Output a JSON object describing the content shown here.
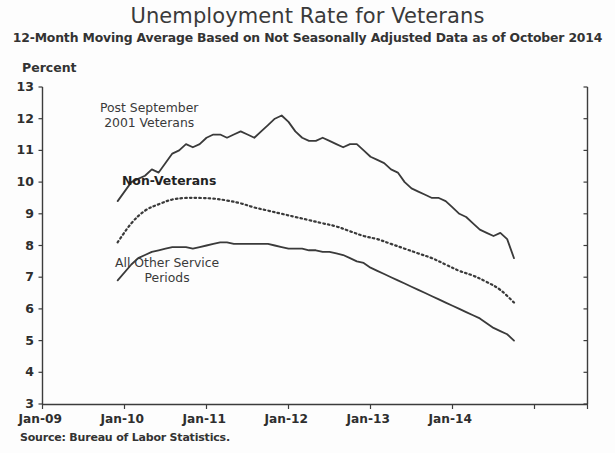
{
  "chart_data": {
    "type": "line",
    "title": "Unemployment Rate for Veterans",
    "subtitle": "12-Month Moving Average Based on Not Seasonally Adjusted Data as of October 2014",
    "ylabel": "Percent",
    "xlabel": "",
    "source": "Source: Bureau of Labor Statistics.",
    "ylim": [
      3,
      13
    ],
    "y_ticks": [
      3,
      4,
      5,
      6,
      7,
      8,
      9,
      10,
      11,
      12,
      13
    ],
    "x_tick_labels": [
      "Jan-09",
      "Jan-10",
      "Jan-11",
      "Jan-12",
      "Jan-13",
      "Jan-14"
    ],
    "x_range": [
      "Jan-09",
      "Jan-15"
    ],
    "grid": false,
    "legend": "inline-annotations",
    "series": [
      {
        "name": "Post September 2001 Veterans",
        "style": "solid",
        "color": "#3a3a3a",
        "x": [
          "Dec-09",
          "Feb-10",
          "Mar-10",
          "Apr-10",
          "May-10",
          "Jun-10",
          "Jul-10",
          "Aug-10",
          "Sep-10",
          "Oct-10",
          "Nov-10",
          "Dec-10",
          "Jan-11",
          "Feb-11",
          "Mar-11",
          "Apr-11",
          "May-11",
          "Jun-11",
          "Jul-11",
          "Aug-11",
          "Sep-11",
          "Oct-11",
          "Nov-11",
          "Dec-11",
          "Jan-12",
          "Feb-12",
          "Mar-12",
          "Apr-12",
          "May-12",
          "Jun-12",
          "Jul-12",
          "Aug-12",
          "Sep-12",
          "Oct-12",
          "Nov-12",
          "Dec-12",
          "Jan-13",
          "Feb-13",
          "Mar-13",
          "Apr-13",
          "May-13",
          "Jun-13",
          "Jul-13",
          "Aug-13",
          "Sep-13",
          "Oct-13",
          "Nov-13",
          "Dec-13",
          "Jan-14",
          "Feb-14",
          "Mar-14",
          "Apr-14",
          "May-14",
          "Jun-14",
          "Jul-14",
          "Aug-14",
          "Sep-14",
          "Oct-14"
        ],
        "values": [
          9.4,
          10.0,
          10.1,
          10.2,
          10.4,
          10.3,
          10.6,
          10.9,
          11.0,
          11.2,
          11.1,
          11.2,
          11.4,
          11.5,
          11.5,
          11.4,
          11.5,
          11.6,
          11.5,
          11.4,
          11.6,
          11.8,
          12.0,
          12.1,
          11.9,
          11.6,
          11.4,
          11.3,
          11.3,
          11.4,
          11.3,
          11.2,
          11.1,
          11.2,
          11.2,
          11.0,
          10.8,
          10.7,
          10.6,
          10.4,
          10.3,
          10.0,
          9.8,
          9.7,
          9.6,
          9.5,
          9.5,
          9.4,
          9.2,
          9.0,
          8.9,
          8.7,
          8.5,
          8.4,
          8.3,
          8.4,
          8.2,
          7.6
        ],
        "start_value": 9.4,
        "peak_value": 12.1,
        "peak_x": "Dec-11",
        "end_value": 7.6
      },
      {
        "name": "Non-Veterans",
        "style": "dotted",
        "color": "#3a3a3a",
        "x": [
          "Dec-09",
          "Feb-10",
          "Apr-10",
          "Jun-10",
          "Aug-10",
          "Oct-10",
          "Dec-10",
          "Feb-11",
          "Apr-11",
          "Jun-11",
          "Aug-11",
          "Oct-11",
          "Dec-11",
          "Feb-12",
          "Apr-12",
          "Jun-12",
          "Aug-12",
          "Oct-12",
          "Dec-12",
          "Feb-13",
          "Apr-13",
          "Jun-13",
          "Aug-13",
          "Oct-13",
          "Dec-13",
          "Feb-14",
          "Apr-14",
          "Jun-14",
          "Aug-14",
          "Oct-14"
        ],
        "values": [
          8.1,
          8.7,
          9.1,
          9.3,
          9.45,
          9.5,
          9.5,
          9.48,
          9.42,
          9.33,
          9.2,
          9.1,
          9.0,
          8.9,
          8.8,
          8.7,
          8.6,
          8.45,
          8.3,
          8.2,
          8.05,
          7.9,
          7.75,
          7.6,
          7.4,
          7.2,
          7.05,
          6.85,
          6.6,
          6.2
        ],
        "start_value": 8.1,
        "peak_value": 9.5,
        "peak_x": "Oct-10",
        "end_value": 6.2
      },
      {
        "name": "All Other Service Periods",
        "style": "solid",
        "color": "#3a3a3a",
        "x": [
          "Dec-09",
          "Feb-10",
          "Mar-10",
          "Apr-10",
          "May-10",
          "Jun-10",
          "Jul-10",
          "Aug-10",
          "Sep-10",
          "Oct-10",
          "Nov-10",
          "Dec-10",
          "Jan-11",
          "Feb-11",
          "Mar-11",
          "Apr-11",
          "May-11",
          "Jun-11",
          "Jul-11",
          "Aug-11",
          "Sep-11",
          "Oct-11",
          "Nov-11",
          "Dec-11",
          "Jan-12",
          "Feb-12",
          "Mar-12",
          "Apr-12",
          "May-12",
          "Jun-12",
          "Jul-12",
          "Aug-12",
          "Sep-12",
          "Oct-12",
          "Nov-12",
          "Dec-12",
          "Jan-13",
          "Feb-13",
          "Mar-13",
          "Apr-13",
          "May-13",
          "Jun-13",
          "Jul-13",
          "Aug-13",
          "Sep-13",
          "Oct-13",
          "Nov-13",
          "Dec-13",
          "Jan-14",
          "Feb-14",
          "Mar-14",
          "Apr-14",
          "May-14",
          "Jun-14",
          "Jul-14",
          "Aug-14",
          "Sep-14",
          "Oct-14"
        ],
        "values": [
          6.9,
          7.4,
          7.6,
          7.7,
          7.8,
          7.85,
          7.9,
          7.95,
          7.95,
          7.95,
          7.9,
          7.95,
          8.0,
          8.05,
          8.1,
          8.1,
          8.05,
          8.05,
          8.05,
          8.05,
          8.05,
          8.05,
          8.0,
          7.95,
          7.9,
          7.9,
          7.9,
          7.85,
          7.85,
          7.8,
          7.8,
          7.75,
          7.7,
          7.6,
          7.5,
          7.45,
          7.3,
          7.2,
          7.1,
          7.0,
          6.9,
          6.8,
          6.7,
          6.6,
          6.5,
          6.4,
          6.3,
          6.2,
          6.1,
          6.0,
          5.9,
          5.8,
          5.7,
          5.55,
          5.4,
          5.3,
          5.2,
          5.0
        ],
        "start_value": 6.9,
        "peak_value": 8.1,
        "peak_x": "Mar-11",
        "end_value": 5.0
      }
    ],
    "annotations": [
      {
        "text_line1": "Post September",
        "text_line2": "2001 Veterans",
        "bold": false
      },
      {
        "text_line1": "Non-Veterans",
        "text_line2": "",
        "bold": true
      },
      {
        "text_line1": "All Other Service",
        "text_line2": "Periods",
        "bold": false
      }
    ]
  }
}
